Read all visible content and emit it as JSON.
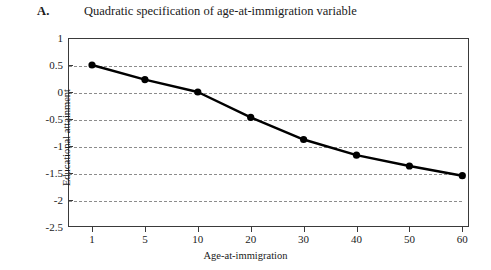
{
  "figure": {
    "panel_letter": "A.",
    "title": "Quadratic specification of age-at-immigration variable"
  },
  "chart_data": {
    "type": "line",
    "title": "Quadratic specification of age-at-immigration variable",
    "xlabel": "Age-at-immigration",
    "ylabel": "Educational attainment",
    "categories": [
      "1",
      "5",
      "10",
      "20",
      "30",
      "40",
      "50",
      "60"
    ],
    "values": [
      0.5,
      0.23,
      0.0,
      -0.47,
      -0.88,
      -1.17,
      -1.37,
      -1.55
    ],
    "series": [
      {
        "name": "Educational attainment",
        "values": [
          0.5,
          0.23,
          0.0,
          -0.47,
          -0.88,
          -1.17,
          -1.37,
          -1.55
        ]
      }
    ],
    "ylim": [
      -2.5,
      1
    ],
    "yticks": [
      1,
      0.5,
      0,
      -0.5,
      -1,
      -1.5,
      -2,
      -2.5
    ],
    "ytick_labels": [
      "1",
      "0.5",
      "0",
      "-0.5",
      "-1",
      "-1.5",
      "-2",
      "-2.5"
    ],
    "xtick_labels": [
      "1",
      "5",
      "10",
      "20",
      "30",
      "40",
      "50",
      "60"
    ],
    "grid": "horizontal-dashed",
    "legend": "none",
    "marker": "filled-circle",
    "line_color": "#000000",
    "grid_color": "#8c8c8c",
    "axis_color": "#3a3a3a",
    "background_color": "#ffffff"
  }
}
